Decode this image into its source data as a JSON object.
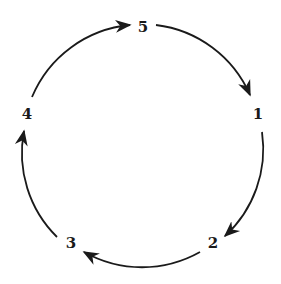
{
  "diagram": {
    "type": "directed-cycle",
    "nodes": [
      {
        "id": "5",
        "label": "5",
        "x": 143,
        "y": 27
      },
      {
        "id": "1",
        "label": "1",
        "x": 258,
        "y": 114
      },
      {
        "id": "2",
        "label": "2",
        "x": 213,
        "y": 243
      },
      {
        "id": "3",
        "label": "3",
        "x": 71,
        "y": 243
      },
      {
        "id": "4",
        "label": "4",
        "x": 27,
        "y": 114
      }
    ],
    "edges": [
      {
        "from": "5",
        "to": "1"
      },
      {
        "from": "1",
        "to": "2"
      },
      {
        "from": "2",
        "to": "3"
      },
      {
        "from": "3",
        "to": "4"
      },
      {
        "from": "4",
        "to": "5"
      }
    ],
    "colors": {
      "stroke": "#1a1a1a",
      "background": "#ffffff"
    }
  }
}
